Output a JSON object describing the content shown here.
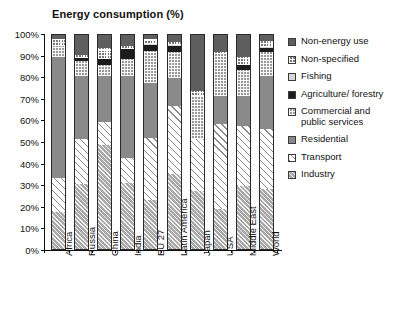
{
  "chart_data": {
    "type": "bar",
    "subtype": "stacked-percent",
    "title": "Energy consumption (%)",
    "xlabel": "",
    "ylabel": "",
    "ylim": [
      0,
      100
    ],
    "ytick_labels": [
      "0%",
      "10%",
      "20%",
      "30%",
      "40%",
      "50%",
      "60%",
      "70%",
      "80%",
      "90%",
      "100%"
    ],
    "ytick_values": [
      0,
      10,
      20,
      30,
      40,
      50,
      60,
      70,
      80,
      90,
      100
    ],
    "grid": false,
    "legend_position": "right",
    "categories": [
      "Africa",
      "Russia",
      "China",
      "India",
      "EU 27",
      "Latin America",
      "Japan",
      "USA",
      "Middle East",
      "World"
    ],
    "series": [
      {
        "name": "Industry",
        "pattern": "industry",
        "color": "#a8a8a8",
        "values": [
          17.0,
          30.0,
          48.0,
          30.5,
          22.5,
          34.5,
          27.0,
          18.5,
          29.0,
          28.0
        ]
      },
      {
        "name": "Transport",
        "pattern": "transport",
        "color": "#ffffff",
        "values": [
          16.0,
          21.0,
          11.0,
          11.5,
          29.0,
          31.5,
          24.0,
          39.5,
          28.0,
          27.5
        ]
      },
      {
        "name": "Residential",
        "pattern": "residential",
        "color": "#8a8a8a",
        "values": [
          56.0,
          29.0,
          21.0,
          38.0,
          25.5,
          13.0,
          0.0,
          13.0,
          14.0,
          24.5
        ]
      },
      {
        "name": "Commercial and public services",
        "pattern": "commercial",
        "color": "#9a9a9a",
        "values": [
          5.0,
          7.0,
          5.0,
          8.0,
          14.5,
          12.0,
          20.0,
          19.5,
          12.0,
          11.0
        ]
      },
      {
        "name": "Agriculture/ forestry",
        "pattern": "agriculture",
        "color": "#1c1c1c",
        "values": [
          0.0,
          1.5,
          3.0,
          4.5,
          3.0,
          3.0,
          0.0,
          0.0,
          2.0,
          2.0
        ]
      },
      {
        "name": "Fishing",
        "pattern": "fishing",
        "color": "#d8d8d8",
        "values": [
          0.0,
          0.0,
          0.0,
          0.0,
          0.5,
          0.5,
          0.0,
          0.0,
          0.0,
          0.5
        ]
      },
      {
        "name": "Non-specified",
        "pattern": "nonspecified",
        "color": "#7a7a7a",
        "values": [
          3.0,
          1.5,
          5.0,
          1.5,
          2.0,
          1.5,
          2.0,
          0.5,
          4.0,
          3.0
        ]
      },
      {
        "name": "Non-energy use",
        "pattern": "nonenergy",
        "color": "#5e5e5e",
        "values": [
          3.0,
          10.0,
          7.0,
          6.0,
          3.0,
          4.0,
          27.0,
          9.0,
          11.0,
          3.5
        ]
      }
    ]
  },
  "legend": {
    "items": [
      {
        "label": "Non-energy use",
        "pattern": "nonenergy"
      },
      {
        "label": "Non-specified",
        "pattern": "nonspecified"
      },
      {
        "label": "Fishing",
        "pattern": "fishing"
      },
      {
        "label": "Agriculture/ forestry",
        "pattern": "agriculture"
      },
      {
        "label": "Commercial and public services",
        "pattern": "commercial"
      },
      {
        "label": "Residential",
        "pattern": "residential"
      },
      {
        "label": "Transport",
        "pattern": "transport"
      },
      {
        "label": "Industry",
        "pattern": "industry"
      }
    ]
  }
}
